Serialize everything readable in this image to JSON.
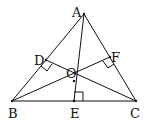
{
  "diagram": {
    "type": "geometry",
    "stroke_color": "#111111",
    "points": {
      "A": {
        "label": "A",
        "x": 84,
        "y": 14
      },
      "B": {
        "label": "B",
        "x": 12,
        "y": 101
      },
      "C": {
        "label": "C",
        "x": 136,
        "y": 101
      },
      "D": {
        "label": "D",
        "x": 46,
        "y": 60
      },
      "E": {
        "label": "E",
        "x": 74,
        "y": 101
      },
      "F": {
        "label": "F",
        "x": 110,
        "y": 57
      },
      "O": {
        "label": "O",
        "x": 74,
        "y": 81
      }
    },
    "segments": [
      [
        "A",
        "B"
      ],
      [
        "B",
        "C"
      ],
      [
        "C",
        "A"
      ],
      [
        "A",
        "E"
      ],
      [
        "B",
        "F"
      ],
      [
        "C",
        "D"
      ]
    ],
    "right_angles": [
      "D",
      "E",
      "F"
    ]
  }
}
